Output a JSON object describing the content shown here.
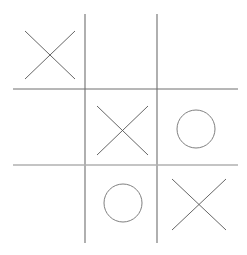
{
  "board": {
    "title": "Tic Tac Toe",
    "rows": 3,
    "cols": 3,
    "background_color": "#ffffff",
    "cells": [
      {
        "id": "cell-top-left",
        "row": 0,
        "col": 0,
        "mark": "X",
        "label": "X"
      },
      {
        "id": "cell-top-center",
        "row": 0,
        "col": 1,
        "mark": "",
        "label": ""
      },
      {
        "id": "cell-top-right",
        "row": 0,
        "col": 2,
        "mark": "",
        "label": ""
      },
      {
        "id": "cell-middle-left",
        "row": 1,
        "col": 0,
        "mark": "",
        "label": ""
      },
      {
        "id": "cell-middle-center",
        "row": 1,
        "col": 1,
        "mark": "X",
        "label": "X"
      },
      {
        "id": "cell-middle-right",
        "row": 1,
        "col": 2,
        "mark": "O",
        "label": "O"
      },
      {
        "id": "cell-bottom-left",
        "row": 2,
        "col": 0,
        "mark": "",
        "label": ""
      },
      {
        "id": "cell-bottom-center",
        "row": 2,
        "col": 1,
        "mark": "O",
        "label": "O"
      },
      {
        "id": "cell-bottom-right",
        "row": 2,
        "col": 2,
        "mark": "X",
        "label": "X"
      }
    ],
    "grid": {
      "vertical_lines": [
        {
          "name": "vertical-line-left",
          "x": 85,
          "y1": 14,
          "y2": 243,
          "color": "#6e6e6e",
          "width": 1.1
        },
        {
          "name": "vertical-line-right",
          "x": 157,
          "y1": 14,
          "y2": 243,
          "color": "#6e6e6e",
          "width": 1.1
        }
      ],
      "horizontal_lines": [
        {
          "name": "horizontal-line-top",
          "y": 89,
          "x1": 13,
          "x2": 238,
          "color": "#6e6e6e",
          "width": 1.0
        },
        {
          "name": "horizontal-line-bottom",
          "y": 165,
          "x1": 13,
          "x2": 238,
          "color": "#b0b0b0",
          "width": 1.6
        }
      ]
    },
    "marks": {
      "x_color": "#555555",
      "o_color": "#808080",
      "x_stroke_width": 0.9,
      "o_stroke_width": 1.0,
      "x_shapes": [
        {
          "name": "x-mark-top-left",
          "cell": "cell-top-left",
          "x1": 25,
          "y1": 31,
          "x2": 75,
          "y2": 79
        },
        {
          "name": "x-mark-middle-center",
          "cell": "cell-middle-center",
          "x1": 97,
          "y1": 106,
          "x2": 148,
          "y2": 155
        },
        {
          "name": "x-mark-bottom-right",
          "cell": "cell-bottom-right",
          "x1": 172,
          "y1": 179,
          "x2": 226,
          "y2": 230
        }
      ],
      "o_shapes": [
        {
          "name": "o-mark-middle-right",
          "cell": "cell-middle-right",
          "cx": 196,
          "cy": 129,
          "rx": 19,
          "ry": 19
        },
        {
          "name": "o-mark-bottom-center",
          "cell": "cell-bottom-center",
          "cx": 123,
          "cy": 203,
          "rx": 19,
          "ry": 19
        }
      ]
    }
  }
}
